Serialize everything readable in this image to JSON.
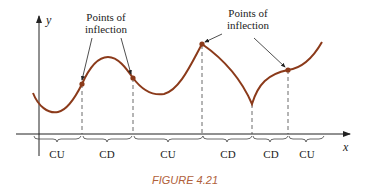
{
  "figure": {
    "caption": "FIGURE 4.21",
    "caption_color": "#b0603a",
    "curve_color": "#8b3a1a",
    "axes": {
      "x_label": "x",
      "y_label": "y"
    },
    "annotations": [
      {
        "line1": "Points of",
        "line2": "inflection"
      },
      {
        "line1": "Points of",
        "line2": "inflection"
      }
    ],
    "intervals": [
      {
        "label": "CU"
      },
      {
        "label": "CD"
      },
      {
        "label": "CU"
      },
      {
        "label": "CD"
      },
      {
        "label": "CD"
      },
      {
        "label": "CU"
      }
    ]
  }
}
